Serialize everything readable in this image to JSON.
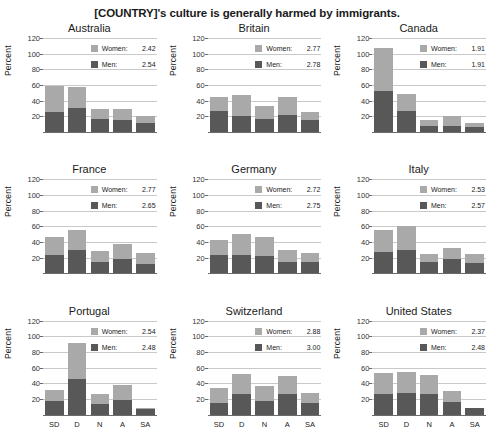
{
  "title": "[COUNTRY]'s culture is generally harmed by immigrants.",
  "axis": {
    "ylabel": "Percent",
    "yticks": [
      "20",
      "40",
      "60",
      "80",
      "100",
      "120"
    ],
    "xticks": [
      "SD",
      "D",
      "N",
      "A",
      "SA"
    ]
  },
  "legend": {
    "women_label": "Women:",
    "men_label": "Men:",
    "women_color": "#a9a9a9",
    "men_color": "#585858"
  },
  "chart_data": {
    "type": "bar",
    "title": "[COUNTRY]'s culture is generally harmed by immigrants.",
    "xlabel": "",
    "ylabel": "Percent",
    "ylim": [
      0,
      120
    ],
    "grid": true,
    "legend_position": "top-right inside each panel",
    "categories": [
      "SD",
      "D",
      "N",
      "A",
      "SA"
    ],
    "category_meanings": [
      "Strongly Disagree",
      "Disagree",
      "Neutral",
      "Agree",
      "Strongly Agree"
    ],
    "stacked": true,
    "series_names": [
      "Men",
      "Women"
    ],
    "panels": [
      {
        "country": "Australia",
        "women_mean": "2.42",
        "men_mean": "2.54",
        "men": [
          26,
          31,
          17,
          15,
          11
        ],
        "women": [
          33,
          26,
          13,
          14,
          10
        ],
        "totals": [
          59,
          57,
          30,
          29,
          21
        ]
      },
      {
        "country": "Britain",
        "women_mean": "2.77",
        "men_mean": "2.78",
        "men": [
          27,
          20,
          16,
          22,
          15
        ],
        "women": [
          18,
          27,
          17,
          23,
          10
        ],
        "totals": [
          45,
          47,
          33,
          45,
          25
        ]
      },
      {
        "country": "Canada",
        "women_mean": "1.91",
        "men_mean": "1.91",
        "men": [
          52,
          27,
          8,
          8,
          7
        ],
        "women": [
          55,
          21,
          7,
          12,
          5
        ],
        "totals": [
          107,
          48,
          15,
          20,
          12
        ]
      },
      {
        "country": "France",
        "women_mean": "2.77",
        "men_mean": "2.65",
        "men": [
          23,
          30,
          14,
          18,
          12
        ],
        "women": [
          24,
          25,
          14,
          19,
          14
        ],
        "totals": [
          47,
          55,
          28,
          37,
          26
        ]
      },
      {
        "country": "Germany",
        "women_mean": "2.72",
        "men_mean": "2.75",
        "men": [
          23,
          24,
          22,
          15,
          15
        ],
        "women": [
          20,
          26,
          24,
          15,
          11
        ],
        "totals": [
          43,
          50,
          46,
          30,
          26
        ]
      },
      {
        "country": "Italy",
        "women_mean": "2.53",
        "men_mean": "2.57",
        "men": [
          27,
          30,
          14,
          18,
          13
        ],
        "women": [
          28,
          31,
          11,
          14,
          12
        ],
        "totals": [
          55,
          61,
          25,
          32,
          25
        ]
      },
      {
        "country": "Portugal",
        "women_mean": "2.54",
        "men_mean": "2.48",
        "men": [
          18,
          45,
          13,
          19,
          7
        ],
        "women": [
          14,
          46,
          13,
          19,
          1
        ],
        "totals": [
          32,
          91,
          26,
          38,
          8
        ]
      },
      {
        "country": "Switzerland",
        "women_mean": "2.88",
        "men_mean": "3.00",
        "men": [
          15,
          26,
          18,
          27,
          15
        ],
        "women": [
          19,
          26,
          18,
          23,
          13
        ],
        "totals": [
          34,
          52,
          36,
          50,
          28
        ]
      },
      {
        "country": "United States",
        "women_mean": "2.37",
        "men_mean": "2.48",
        "men": [
          26,
          28,
          27,
          16,
          8
        ],
        "women": [
          27,
          27,
          24,
          14,
          1
        ],
        "totals": [
          53,
          55,
          51,
          30,
          9
        ]
      }
    ]
  }
}
